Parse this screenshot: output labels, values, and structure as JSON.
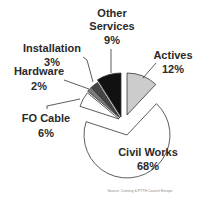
{
  "chart_data": {
    "type": "pie",
    "title": "",
    "categories": [
      "Actives",
      "Civil Works",
      "FO Cable",
      "Hardware",
      "Installation",
      "Other Services"
    ],
    "values": [
      12,
      68,
      6,
      2,
      3,
      9
    ],
    "unit": "%",
    "labels": [
      {
        "name": "Actives",
        "value_label": "12%"
      },
      {
        "name": "Civil Works",
        "value_label": "68%"
      },
      {
        "name": "FO Cable",
        "value_label": "6%"
      },
      {
        "name": "Hardware",
        "value_label": "2%"
      },
      {
        "name": "Installation",
        "value_label": "3%"
      },
      {
        "name": "Other Services",
        "name_lines": [
          "Other",
          "Services"
        ],
        "value_label": "9%"
      }
    ],
    "colors": [
      "#cccccc",
      "#ffffff",
      "#ffffff",
      "#7a7a7a",
      "#454545",
      "#111111"
    ],
    "start_angle_deg": 0,
    "direction": "clockwise",
    "exploded": true,
    "legend": "none",
    "source": "Source: Corning & FTTH Council Europe"
  }
}
